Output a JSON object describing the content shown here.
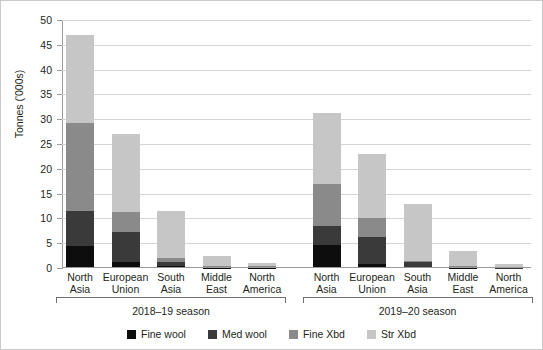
{
  "chart_data": {
    "type": "bar",
    "subtype": "stacked",
    "title": "",
    "xlabel": "",
    "ylabel": "Tonnes ('000s)",
    "ylim": [
      0,
      50
    ],
    "yticks": [
      0,
      5,
      10,
      15,
      20,
      25,
      30,
      35,
      40,
      45,
      50
    ],
    "grid": true,
    "legend_position": "bottom",
    "categories": [
      "North Asia",
      "European Union",
      "South Asia",
      "Middle East",
      "North America",
      "North Asia",
      "European Union",
      "South Asia",
      "Middle East",
      "North America"
    ],
    "groups": [
      {
        "label": "2018–19 season",
        "categories": [
          "North Asia",
          "European Union",
          "South Asia",
          "Middle East",
          "North America"
        ]
      },
      {
        "label": "2019–20 season",
        "categories": [
          "North Asia",
          "European Union",
          "South Asia",
          "Middle East",
          "North America"
        ]
      }
    ],
    "series": [
      {
        "name": "Fine wool",
        "color": "#0d0d0d",
        "values": [
          4.4,
          1.2,
          0.5,
          0.1,
          0.1,
          4.6,
          0.9,
          0.3,
          0.1,
          0.05
        ]
      },
      {
        "name": "Med wool",
        "color": "#3a3a3a",
        "values": [
          7.1,
          6.1,
          0.7,
          0.1,
          0.1,
          3.9,
          5.4,
          0.9,
          0.1,
          0.05
        ]
      },
      {
        "name": "Fine Xbd",
        "color": "#8a8a8a",
        "values": [
          17.8,
          3.9,
          0.8,
          0.2,
          0.3,
          8.4,
          3.8,
          0.3,
          0.2,
          0.2
        ]
      },
      {
        "name": "Str Xbd",
        "color": "#c6c6c6",
        "values": [
          17.7,
          15.8,
          9.4,
          2.1,
          0.6,
          14.4,
          12.9,
          11.5,
          3.1,
          0.6
        ]
      }
    ],
    "totals": [
      47.0,
      27.0,
      11.4,
      2.5,
      1.1,
      31.3,
      23.0,
      13.0,
      3.5,
      0.9
    ]
  },
  "axis": {
    "y_title": "Tonnes ('000s)",
    "y_ticks": [
      "0",
      "5",
      "10",
      "15",
      "20",
      "25",
      "30",
      "35",
      "40",
      "45",
      "50"
    ]
  },
  "category_labels": [
    {
      "line1": "North",
      "line2": "Asia"
    },
    {
      "line1": "European",
      "line2": "Union"
    },
    {
      "line1": "South",
      "line2": "Asia"
    },
    {
      "line1": "Middle",
      "line2": "East"
    },
    {
      "line1": "North",
      "line2": "America"
    },
    {
      "line1": "North",
      "line2": "Asia"
    },
    {
      "line1": "European",
      "line2": "Union"
    },
    {
      "line1": "South",
      "line2": "Asia"
    },
    {
      "line1": "Middle",
      "line2": "East"
    },
    {
      "line1": "North",
      "line2": "America"
    }
  ],
  "season_labels": [
    "2018–19 season",
    "2019–20 season"
  ],
  "legend": {
    "items": [
      {
        "label": "Fine wool",
        "color": "#0d0d0d"
      },
      {
        "label": "Med wool",
        "color": "#3a3a3a"
      },
      {
        "label": "Fine Xbd",
        "color": "#8a8a8a"
      },
      {
        "label": "Str Xbd",
        "color": "#c6c6c6"
      }
    ]
  },
  "colors": {
    "fine_wool": "#0d0d0d",
    "med_wool": "#3a3a3a",
    "fine_xbd": "#8a8a8a",
    "str_xbd": "#c6c6c6",
    "gridline": "#d4d4d4",
    "axis": "#9a9a9a",
    "text": "#231f20",
    "background": "#ffffff"
  }
}
